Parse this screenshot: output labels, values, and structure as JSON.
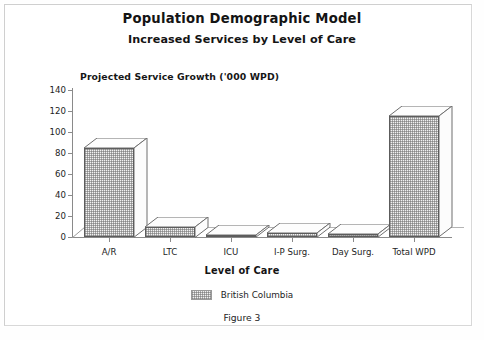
{
  "figure": {
    "title": "Population Demographic Model",
    "subtitle": "Increased Services by Level of Care",
    "caption": "Figure 3"
  },
  "chart_data": {
    "type": "bar",
    "title": "Population Demographic Model",
    "subtitle": "Increased Services by Level of Care",
    "xlabel": "Level of Care",
    "ylabel": "Projected Service Growth ('000 WPD)",
    "categories": [
      "A/R",
      "LTC",
      "ICU",
      "I-P Surg.",
      "Day Surg.",
      "Total WPD"
    ],
    "series": [
      {
        "name": "British Columbia",
        "values": [
          85,
          10,
          2,
          4,
          3,
          115
        ]
      }
    ],
    "ylim": [
      0,
      140
    ],
    "yticks": [
      0,
      20,
      40,
      60,
      80,
      100,
      120,
      140
    ],
    "ytick_labels": [
      "0",
      "20",
      "40",
      "60",
      "80",
      "100",
      "120",
      "140"
    ],
    "grid": false,
    "legend_position": "bottom",
    "style": "3d-column",
    "fill_color": "#f2f2f2",
    "edge_color": "#5c5c5c"
  },
  "legend": {
    "entries": [
      {
        "label": "British Columbia",
        "swatch": "hatched-gray"
      }
    ]
  }
}
